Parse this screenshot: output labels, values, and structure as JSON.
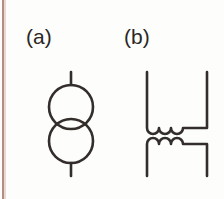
{
  "page": {
    "background_color": "#fdfdfc",
    "edge_line_color": "#a9786e",
    "ink_color": "#332e2b",
    "width": 224,
    "height": 199
  },
  "figure": {
    "type": "circuit-symbol-diagram",
    "caption_style": "parenthesized-letters",
    "items": [
      {
        "label": "(a)",
        "symbol_name": "transformer-two-circles",
        "description": "Two overlapping circles stacked vertically with vertical lead stubs top and bottom",
        "geometry": {
          "circle_diameter": 44,
          "circle_stroke_width": 2.6,
          "top_circle_center": [
            30,
            44
          ],
          "bottom_circle_center": [
            30,
            78
          ],
          "overlap": 10,
          "lead_top": {
            "x": 30,
            "y1": 10,
            "y2": 22
          },
          "lead_bottom": {
            "x": 30,
            "y1": 100,
            "y2": 112
          }
        }
      },
      {
        "label": "(b)",
        "symbol_name": "transformer-two-coils",
        "description": "Two inductor coils facing each other, each with three arcs, with vertical leads",
        "geometry": {
          "coil_arcs": 3,
          "stroke_width": 2.6,
          "primary_coil_y": 74,
          "secondary_coil_y": 80,
          "left_lead_x": 13,
          "right_lead_x": 73,
          "lead_top_y": 10,
          "lead_bottom_y": 112
        }
      }
    ]
  }
}
